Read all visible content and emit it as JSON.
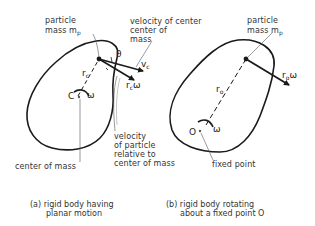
{
  "figure_a": {
    "particle_label_line1": "particle",
    "particle_label_line2": "mass m",
    "particle_label_sub": "p",
    "vc_label_line1": "velocity of center",
    "vc_label_line2": "center of",
    "vc_label_line3": "mass",
    "theta": "θ",
    "vc_symbol": "v",
    "vc_sub": "c",
    "rc_symbol": "r",
    "rc_sub": "c",
    "rcw_symbol": "r",
    "rcw_sub": "c",
    "rcw_omega": "ω",
    "c_symbol": "C",
    "omega": "ω",
    "com_label": "center of mass",
    "rel_label_line1": "velocity",
    "rel_label_line2": "of particle",
    "rel_label_line3": "relative to",
    "rel_label_line4": "center of mass",
    "caption_line1": "(a) rigid body having",
    "caption_line2": "planar motion"
  },
  "figure_b": {
    "particle_label_line1": "particle",
    "particle_label_line2": "mass m",
    "particle_label_sub": "p",
    "ro_symbol": "r",
    "ro_sub": "o",
    "row_symbol": "r",
    "row_sub": "o",
    "row_omega": "ω",
    "o_symbol": "O",
    "omega": "ω",
    "fixed_label": "fixed point",
    "caption_line1": "(b) rigid body rotating",
    "caption_line2": "about a fixed point O"
  },
  "colors": {
    "ink": "#1a1a1a",
    "leader": "#555555",
    "background": "#ffffff"
  }
}
